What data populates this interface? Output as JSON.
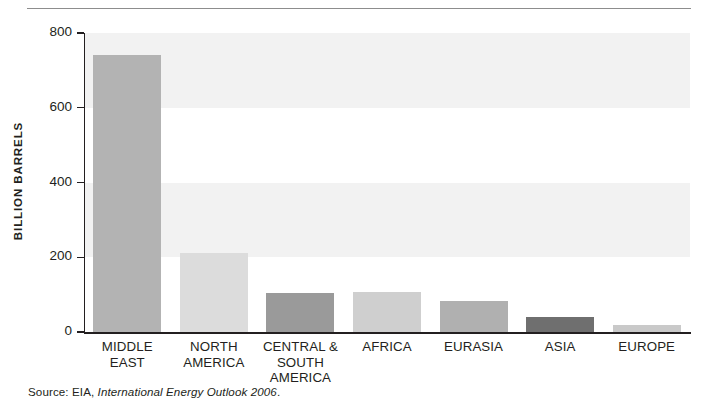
{
  "chart_data": {
    "type": "bar",
    "title": "",
    "subtitle": "",
    "xlabel": "",
    "ylabel": "BILLION BARRELS",
    "categories": [
      "MIDDLE EAST",
      "NORTH AMERICA",
      "CENTRAL & SOUTH AMERICA",
      "AFRICA",
      "EURASIA",
      "ASIA",
      "EUROPE"
    ],
    "category_lines": [
      [
        "MIDDLE",
        "EAST"
      ],
      [
        "NORTH",
        "AMERICA"
      ],
      [
        "CENTRAL &",
        "SOUTH",
        "AMERICA"
      ],
      [
        "AFRICA"
      ],
      [
        "EURASIA"
      ],
      [
        "ASIA"
      ],
      [
        "EUROPE"
      ]
    ],
    "values": [
      742,
      211,
      104,
      107,
      83,
      40,
      19
    ],
    "bar_colors": [
      "#b3b3b3",
      "#dcdcdc",
      "#9a9a9a",
      "#cfcfcf",
      "#b0b0b0",
      "#6f6f6f",
      "#c9c9c9"
    ],
    "ylim": [
      0,
      800
    ],
    "ytick_values": [
      0,
      200,
      400,
      600,
      800
    ],
    "ytick_labels": [
      "0",
      "200",
      "400",
      "600",
      "800"
    ],
    "grid": false,
    "banded_background": true,
    "band_color": "#f2f2f2",
    "axis_color": "#231f20",
    "legend": null,
    "legend_position": "none",
    "units": "billion barrels"
  },
  "source": {
    "prefix": "Source: EIA, ",
    "publication": "International Energy Outlook 2006",
    "suffix": "."
  }
}
